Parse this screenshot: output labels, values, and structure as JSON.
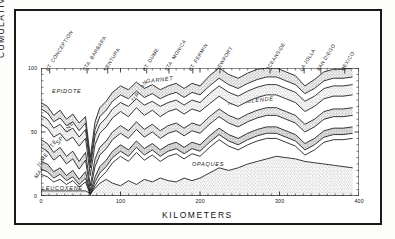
{
  "chart_data": {
    "type": "area",
    "title": "",
    "xlabel": "KILOMETERS",
    "ylabel": "CUMULATIVE  PERCENTAGE",
    "xlim": [
      0,
      400
    ],
    "ylim": [
      0,
      100
    ],
    "xticks": [
      "0",
      "100",
      "200",
      "300",
      "400"
    ],
    "yticks": [
      "0",
      "50",
      "100"
    ],
    "grid": false,
    "legend_position": "inline-labels",
    "stacking": "cumulative-percent-top-down",
    "locations": [
      {
        "label": "PT. CONCEPTION",
        "km": 11
      },
      {
        "label": "STA. BARBARA",
        "km": 58
      },
      {
        "label": "VENTURA",
        "km": 84
      },
      {
        "label": "PT. DUME",
        "km": 133
      },
      {
        "label": "STA. MONICA",
        "km": 161
      },
      {
        "label": "PT. FERMIN",
        "km": 191
      },
      {
        "label": "NEWPORT",
        "km": 225
      },
      {
        "label": "OCEANSIDE",
        "km": 288
      },
      {
        "label": "LA JOLLA",
        "km": 331
      },
      {
        "label": "SAN DIEGO",
        "km": 352
      },
      {
        "label": "MEXICO",
        "km": 382
      }
    ],
    "x": [
      0,
      8,
      16,
      24,
      32,
      40,
      48,
      56,
      62,
      68,
      74,
      82,
      90,
      100,
      110,
      120,
      130,
      140,
      150,
      160,
      170,
      180,
      190,
      200,
      212,
      224,
      236,
      248,
      260,
      272,
      284,
      296,
      308,
      320,
      332,
      344,
      356,
      368,
      380,
      392
    ],
    "series": [
      {
        "name": "EPIDOTE",
        "label": "EPIDOTE",
        "top_boundary": [
          100,
          100,
          100,
          100,
          100,
          100,
          100,
          100,
          100,
          100,
          100,
          100,
          100,
          100,
          100,
          100,
          100,
          100,
          100,
          100,
          100,
          100,
          100,
          100,
          100,
          100,
          100,
          100,
          100,
          100,
          100,
          100,
          100,
          100,
          100,
          100,
          100,
          100,
          100,
          100
        ],
        "bottom_boundary": [
          73,
          70,
          63,
          67,
          60,
          64,
          57,
          62,
          30,
          58,
          69,
          74,
          81,
          86,
          83,
          89,
          84,
          87,
          83,
          86,
          88,
          84,
          88,
          86,
          94,
          100,
          95,
          92,
          96,
          99,
          100,
          100,
          97,
          94,
          86,
          91,
          97,
          99,
          99,
          100
        ]
      },
      {
        "name": "GARNET",
        "label": "GARNET",
        "bottom_boundary": [
          68,
          65,
          58,
          61,
          55,
          58,
          51,
          57,
          26,
          52,
          62,
          67,
          74,
          79,
          76,
          82,
          77,
          80,
          76,
          79,
          81,
          77,
          81,
          79,
          86,
          92,
          87,
          84,
          88,
          91,
          93,
          93,
          90,
          87,
          80,
          84,
          90,
          92,
          92,
          93
        ]
      },
      {
        "name": "ZIRCON",
        "label": "ZIRCON",
        "bottom_boundary": [
          63,
          60,
          53,
          56,
          50,
          53,
          46,
          52,
          22,
          47,
          56,
          61,
          68,
          73,
          70,
          76,
          71,
          74,
          70,
          73,
          75,
          71,
          75,
          73,
          80,
          86,
          81,
          78,
          82,
          85,
          87,
          87,
          84,
          81,
          74,
          78,
          84,
          86,
          86,
          87
        ]
      },
      {
        "name": "AUGITE",
        "label": "AUGITE",
        "bottom_boundary": [
          56,
          53,
          46,
          49,
          43,
          46,
          39,
          45,
          16,
          40,
          49,
          54,
          61,
          66,
          62,
          69,
          63,
          67,
          62,
          66,
          68,
          64,
          68,
          66,
          72,
          78,
          73,
          70,
          74,
          77,
          79,
          79,
          76,
          73,
          66,
          70,
          76,
          78,
          78,
          79
        ]
      },
      {
        "name": "HORNBLENDE",
        "label": "HORNBLENDE",
        "bottom_boundary": [
          44,
          41,
          34,
          38,
          31,
          35,
          27,
          34,
          8,
          29,
          38,
          43,
          50,
          55,
          51,
          58,
          52,
          56,
          51,
          55,
          57,
          53,
          57,
          55,
          62,
          68,
          63,
          60,
          64,
          67,
          69,
          69,
          66,
          63,
          56,
          60,
          66,
          68,
          68,
          69
        ]
      },
      {
        "name": "SPHENE",
        "label": "SPHENE",
        "bottom_boundary": [
          38,
          35,
          28,
          32,
          25,
          29,
          21,
          28,
          4,
          23,
          32,
          37,
          44,
          49,
          45,
          52,
          46,
          50,
          45,
          49,
          51,
          47,
          51,
          49,
          56,
          62,
          57,
          54,
          58,
          61,
          63,
          63,
          60,
          57,
          50,
          54,
          60,
          62,
          62,
          63
        ]
      },
      {
        "name": "ILMENITE",
        "label": "ILMENITE",
        "bottom_boundary": [
          27,
          25,
          19,
          22,
          16,
          20,
          13,
          19,
          2,
          15,
          23,
          28,
          35,
          40,
          36,
          43,
          37,
          41,
          36,
          40,
          42,
          38,
          42,
          40,
          47,
          53,
          48,
          45,
          49,
          52,
          54,
          54,
          51,
          48,
          41,
          45,
          51,
          53,
          53,
          54
        ]
      },
      {
        "name": "MAGNETITE",
        "label": "MAG.",
        "bottom_boundary": [
          21,
          19,
          14,
          17,
          12,
          15,
          9,
          14,
          1,
          11,
          18,
          23,
          30,
          35,
          31,
          38,
          32,
          36,
          31,
          35,
          37,
          33,
          37,
          35,
          42,
          48,
          43,
          40,
          44,
          47,
          49,
          49,
          46,
          43,
          36,
          40,
          46,
          48,
          48,
          49
        ]
      },
      {
        "name": "LEUCOXENE",
        "label": "LEUCOXENE",
        "bottom_boundary": [
          17,
          15,
          11,
          13,
          9,
          12,
          7,
          11,
          1,
          8,
          14,
          19,
          26,
          31,
          27,
          34,
          28,
          32,
          27,
          31,
          33,
          29,
          33,
          31,
          38,
          44,
          39,
          36,
          40,
          43,
          45,
          45,
          42,
          39,
          32,
          36,
          42,
          44,
          44,
          45
        ]
      },
      {
        "name": "OPAQUES",
        "label": "OPAQUES",
        "bottom_boundary": [
          4,
          4,
          4,
          4,
          4,
          4,
          4,
          4,
          2,
          6,
          10,
          13,
          10,
          8,
          12,
          9,
          13,
          11,
          14,
          12,
          11,
          14,
          12,
          14,
          18,
          22,
          20,
          22,
          25,
          27,
          29,
          31,
          30,
          29,
          27,
          26,
          25,
          24,
          23,
          22
        ]
      },
      {
        "name": "MISCELLANEOUS",
        "label": "MISCELLANEOUS",
        "bottom_boundary": [
          0,
          0,
          0,
          0,
          0,
          0,
          0,
          0,
          0,
          0,
          0,
          0,
          0,
          0,
          0,
          0,
          0,
          0,
          0,
          0,
          0,
          0,
          0,
          0,
          0,
          0,
          0,
          0,
          0,
          0,
          0,
          0,
          0,
          0,
          0,
          0,
          0,
          0,
          0,
          0
        ]
      }
    ]
  }
}
